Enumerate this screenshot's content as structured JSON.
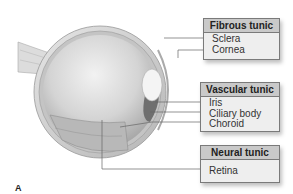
{
  "figure_label": "A",
  "groups": [
    {
      "title": "Fibrous tunic",
      "items": [
        "Sclera",
        "Cornea"
      ]
    },
    {
      "title": "Vascular tunic",
      "items": [
        "Iris",
        "Ciliary body",
        "Choroid"
      ]
    },
    {
      "title": "Neural tunic",
      "items": [
        "Retina"
      ]
    }
  ],
  "colors": {
    "header_bg": "#c9c9c9",
    "box_bg": "#eeeeee",
    "border": "#7a7a7a",
    "leader_line": "#666666"
  }
}
